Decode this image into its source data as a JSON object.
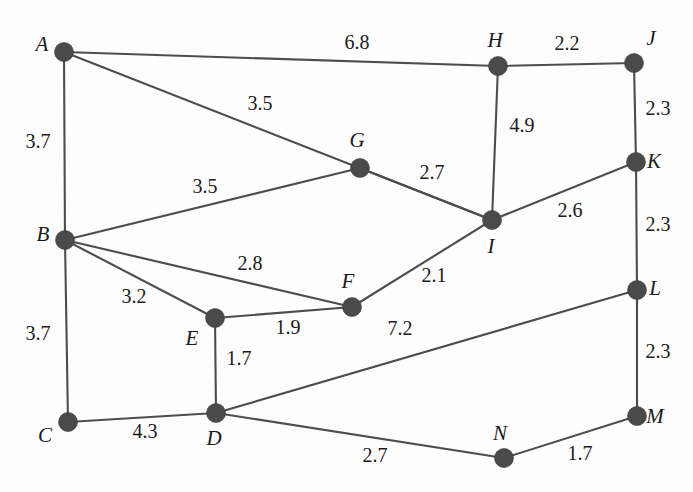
{
  "figure": {
    "background_color": "#fdfdfd",
    "node_color": "#4a4a4a",
    "edge_color": "#4d4d4d",
    "text_color": "#1a1a1a"
  },
  "chart_data": {
    "type": "diagram",
    "title": "",
    "subtitle": "",
    "xlabel": "",
    "ylabel": "",
    "graph_kind": "weighted-undirected-graph",
    "node_count": 14,
    "edge_count": 19,
    "nodes": [
      {
        "id": "A",
        "label": "A",
        "x": 64,
        "y": 52,
        "label_x": 42,
        "label_y": 46
      },
      {
        "id": "B",
        "label": "B",
        "x": 65,
        "y": 240,
        "label_x": 43,
        "label_y": 236
      },
      {
        "id": "C",
        "label": "C",
        "x": 68,
        "y": 422,
        "label_x": 45,
        "label_y": 437
      },
      {
        "id": "D",
        "label": "D",
        "x": 216,
        "y": 413,
        "label_x": 214,
        "label_y": 440
      },
      {
        "id": "E",
        "label": "E",
        "x": 215,
        "y": 318,
        "label_x": 192,
        "label_y": 340
      },
      {
        "id": "F",
        "label": "F",
        "x": 352,
        "y": 307,
        "label_x": 348,
        "label_y": 283
      },
      {
        "id": "G",
        "label": "G",
        "x": 360,
        "y": 168,
        "label_x": 357,
        "label_y": 142
      },
      {
        "id": "H",
        "label": "H",
        "x": 498,
        "y": 66,
        "label_x": 495,
        "label_y": 42
      },
      {
        "id": "I",
        "label": "I",
        "x": 492,
        "y": 220,
        "label_x": 491,
        "label_y": 248
      },
      {
        "id": "J",
        "label": "J",
        "x": 634,
        "y": 63,
        "label_x": 651,
        "label_y": 40
      },
      {
        "id": "K",
        "label": "K",
        "x": 636,
        "y": 162,
        "label_x": 654,
        "label_y": 163
      },
      {
        "id": "L",
        "label": "L",
        "x": 637,
        "y": 290,
        "label_x": 655,
        "label_y": 290
      },
      {
        "id": "M",
        "label": "M",
        "x": 637,
        "y": 416,
        "label_x": 655,
        "label_y": 418
      },
      {
        "id": "N",
        "label": "N",
        "x": 504,
        "y": 458,
        "label_x": 500,
        "label_y": 435
      }
    ],
    "edges": [
      {
        "from": "A",
        "to": "H",
        "weight": "6.8",
        "label_x": 357,
        "label_y": 44
      },
      {
        "from": "A",
        "to": "B",
        "weight": "3.7",
        "label_x": 38,
        "label_y": 143
      },
      {
        "from": "A",
        "to": "I",
        "weight": "3.5",
        "label_x": 260,
        "label_y": 105
      },
      {
        "from": "B",
        "to": "G",
        "weight": "3.5",
        "label_x": 205,
        "label_y": 188
      },
      {
        "from": "B",
        "to": "F",
        "weight": "2.8",
        "label_x": 250,
        "label_y": 265
      },
      {
        "from": "B",
        "to": "E",
        "weight": "3.2",
        "label_x": 134,
        "label_y": 298
      },
      {
        "from": "B",
        "to": "C",
        "weight": "3.7",
        "label_x": 38,
        "label_y": 335
      },
      {
        "from": "C",
        "to": "D",
        "weight": "4.3",
        "label_x": 145,
        "label_y": 433
      },
      {
        "from": "E",
        "to": "F",
        "weight": "1.9",
        "label_x": 288,
        "label_y": 329
      },
      {
        "from": "E",
        "to": "D",
        "weight": "1.7",
        "label_x": 239,
        "label_y": 360
      },
      {
        "from": "F",
        "to": "I",
        "weight": "2.1",
        "label_x": 434,
        "label_y": 277
      },
      {
        "from": "G",
        "to": "I",
        "weight": "2.7",
        "label_x": 432,
        "label_y": 174
      },
      {
        "from": "H",
        "to": "J",
        "weight": "2.2",
        "label_x": 567,
        "label_y": 45
      },
      {
        "from": "H",
        "to": "I",
        "weight": "4.9",
        "label_x": 522,
        "label_y": 127
      },
      {
        "from": "J",
        "to": "K",
        "weight": "2.3",
        "label_x": 658,
        "label_y": 110
      },
      {
        "from": "I",
        "to": "K",
        "weight": "2.6",
        "label_x": 570,
        "label_y": 212
      },
      {
        "from": "K",
        "to": "L",
        "weight": "2.3",
        "label_x": 658,
        "label_y": 226
      },
      {
        "from": "L",
        "to": "M",
        "weight": "2.3",
        "label_x": 658,
        "label_y": 353
      },
      {
        "from": "D",
        "to": "L",
        "weight": "7.2",
        "label_x": 400,
        "label_y": 330
      },
      {
        "from": "D",
        "to": "N",
        "weight": "2.7",
        "label_x": 375,
        "label_y": 457
      },
      {
        "from": "N",
        "to": "M",
        "weight": "1.7",
        "label_x": 580,
        "label_y": 455
      }
    ]
  }
}
